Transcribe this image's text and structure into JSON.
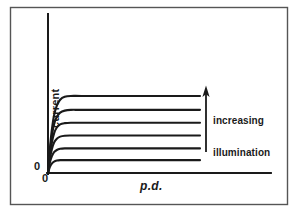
{
  "figure": {
    "caption_absent": true,
    "background_color": "#ffffff",
    "ink_color": "#1a1a1a",
    "border_color": "#555555"
  },
  "axes": {
    "y_label": "current",
    "x_label": "p.d.",
    "origin_label_y": "0",
    "origin_label_x": "0"
  },
  "annotation": {
    "line1": "increasing",
    "line2": "illumination",
    "arrow_direction": "up",
    "arrow_icon": "up-arrow-icon"
  },
  "chart_data": {
    "type": "line",
    "title": "",
    "subtitle": "",
    "xlabel": "p.d.",
    "ylabel": "current",
    "xlim": [
      0,
      100
    ],
    "ylim": [
      0,
      100
    ],
    "grid": false,
    "legend": null,
    "legend_position": "none",
    "axis_ticks": false,
    "annotations": [
      {
        "text": "increasing illumination",
        "type": "arrow-label",
        "arrow_from_x": 71,
        "arrow_from_y": 14,
        "arrow_to_x": 71,
        "arrow_to_y": 54
      }
    ],
    "series": [
      {
        "name": "illumination level 6 (highest)",
        "saturation_current": 72,
        "knee_x": 9.5,
        "x": [
          0,
          1.2,
          2.5,
          4.0,
          5.8,
          8.0,
          11.0,
          15.0,
          22.0,
          40.0,
          70.0,
          100.0
        ],
        "y": [
          0,
          22,
          40,
          54,
          63,
          68.5,
          71.2,
          72,
          72,
          72,
          72,
          72
        ]
      },
      {
        "name": "illumination level 5",
        "saturation_current": 59,
        "knee_x": 8.5,
        "x": [
          0,
          1.2,
          2.5,
          4.0,
          5.8,
          8.0,
          11.0,
          15.0,
          22.0,
          40.0,
          70.0,
          100.0
        ],
        "y": [
          0,
          19,
          34,
          45.5,
          52.5,
          56.5,
          58.3,
          59,
          59,
          59,
          59,
          59
        ]
      },
      {
        "name": "illumination level 4",
        "saturation_current": 47,
        "knee_x": 7.5,
        "x": [
          0,
          1.2,
          2.5,
          4.0,
          5.8,
          8.0,
          11.0,
          15.0,
          22.0,
          40.0,
          70.0,
          100.0
        ],
        "y": [
          0,
          16,
          28,
          37,
          42.5,
          45.5,
          46.6,
          47,
          47,
          47,
          47,
          47
        ]
      },
      {
        "name": "illumination level 3",
        "saturation_current": 35,
        "knee_x": 6.5,
        "x": [
          0,
          1.2,
          2.5,
          4.0,
          5.8,
          8.0,
          11.0,
          15.0,
          22.0,
          40.0,
          70.0,
          100.0
        ],
        "y": [
          0,
          13,
          22,
          28.5,
          32,
          34,
          34.8,
          35,
          35,
          35,
          35,
          35
        ]
      },
      {
        "name": "illumination level 2",
        "saturation_current": 23,
        "knee_x": 5.5,
        "x": [
          0,
          1.2,
          2.5,
          4.0,
          5.8,
          8.0,
          11.0,
          15.0,
          22.0,
          40.0,
          70.0,
          100.0
        ],
        "y": [
          0,
          9.5,
          15.5,
          19.5,
          21.5,
          22.6,
          23,
          23,
          23,
          23,
          23,
          23
        ]
      },
      {
        "name": "illumination level 1 (lowest)",
        "saturation_current": 12,
        "knee_x": 4.5,
        "x": [
          0,
          1.2,
          2.5,
          4.0,
          5.8,
          8.0,
          11.0,
          15.0,
          22.0,
          40.0,
          70.0,
          100.0
        ],
        "y": [
          0,
          5.5,
          8.8,
          10.7,
          11.6,
          12,
          12,
          12,
          12,
          12,
          12,
          12
        ]
      }
    ]
  }
}
